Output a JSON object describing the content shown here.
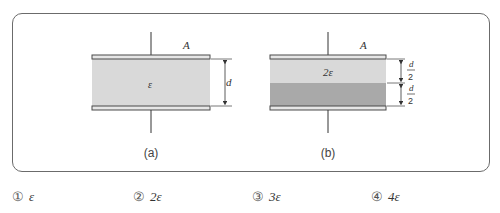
{
  "figures": [
    {
      "id": "a",
      "caption": "(a)",
      "area_label": "A",
      "dielectric_label": "ε",
      "dimension_label": "d",
      "layers": [
        {
          "label": "ε",
          "fill": "#d9d9d9",
          "thickness": "d"
        }
      ]
    },
    {
      "id": "b",
      "caption": "(b)",
      "area_label": "A",
      "dimension_top_num": "d",
      "dimension_top_den": "2",
      "dimension_bottom_num": "d",
      "dimension_bottom_den": "2",
      "layers": [
        {
          "label": "2ε",
          "fill": "#d9d9d9",
          "thickness": "d/2"
        },
        {
          "label": "",
          "fill": "#a9a9a9",
          "thickness": "d/2"
        }
      ]
    }
  ],
  "colors": {
    "frame": "#6b6b6b",
    "plate_fill": "#e6e6e6",
    "plate_stroke": "#4a4a4a",
    "light_dielectric": "#d9d9d9",
    "dark_dielectric": "#a9a9a9"
  },
  "choices": [
    {
      "number": "①",
      "value": "ε"
    },
    {
      "number": "②",
      "value": "2ε"
    },
    {
      "number": "③",
      "value": "3ε"
    },
    {
      "number": "④",
      "value": "4ε"
    }
  ]
}
